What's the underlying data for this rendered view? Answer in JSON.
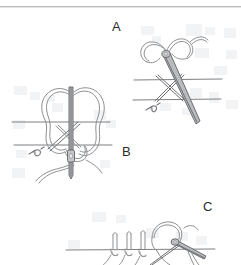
{
  "figure": {
    "style": "pencil line drawing",
    "background_color": "#ffffff",
    "ink_color": "#8d8f92",
    "label_color": "#2b2b2b",
    "rule_color": "#b9bcbe",
    "panels": [
      {
        "id": "A",
        "label": "A",
        "caption": "",
        "description": "Curved needle with suture thread passing through tissue, forming a crossed X stitch between two tissue lines; needle tip exits to the lower right. A small knot mark lies below the lower tissue line.",
        "tissue_lines": 2,
        "needle_orientation": "diagonal",
        "knot_marks": 1
      },
      {
        "id": "B",
        "label": "B",
        "caption": "",
        "description": "Butterfly double-loop suture pattern with a vertical needle passing through two tissue lines; loops of thread extend left and right, with free thread tails trailing below. A small knot mark lies at the left below the lower tissue line.",
        "tissue_lines": 2,
        "needle_orientation": "vertical",
        "knot_marks": 1
      },
      {
        "id": "C",
        "label": "C",
        "caption": "",
        "description": "Three completed vertical loop stitches along a single tissue line with a curved needle and thread entering at the right; image is cropped at the bottom edge.",
        "tissue_lines": 1,
        "needle_orientation": "curved-right",
        "loop_stitches": 3
      }
    ]
  }
}
